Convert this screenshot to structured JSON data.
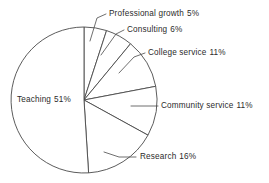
{
  "chart_data": {
    "type": "pie",
    "title": "",
    "subtitle": "",
    "xlabel": "",
    "ylabel": "",
    "legend_position": "none",
    "grid": false,
    "start_angle_deg": 0,
    "direction": "clockwise",
    "units": "percent",
    "total": 100,
    "categories": [
      "Professional growth",
      "Consulting",
      "College service",
      "Community service",
      "Research",
      "Teaching"
    ],
    "values": [
      5,
      6,
      11,
      11,
      16,
      51
    ],
    "slices": [
      {
        "id": "professional-growth",
        "label": "Professional growth",
        "value": 5,
        "value_text": "5%",
        "start_deg": 0,
        "end_deg": 18,
        "label_placement": "outside",
        "fill": "#ffffff",
        "stroke": "#4a4a4a"
      },
      {
        "id": "consulting",
        "label": "Consulting",
        "value": 6,
        "value_text": "6%",
        "start_deg": 18,
        "end_deg": 39.6,
        "label_placement": "outside",
        "fill": "#ffffff",
        "stroke": "#4a4a4a"
      },
      {
        "id": "college-service",
        "label": "College service",
        "value": 11,
        "value_text": "11%",
        "start_deg": 39.6,
        "end_deg": 79.2,
        "label_placement": "outside",
        "fill": "#ffffff",
        "stroke": "#4a4a4a"
      },
      {
        "id": "community-service",
        "label": "Community service",
        "value": 11,
        "value_text": "11%",
        "start_deg": 79.2,
        "end_deg": 118.8,
        "label_placement": "outside",
        "fill": "#ffffff",
        "stroke": "#4a4a4a"
      },
      {
        "id": "research",
        "label": "Research",
        "value": 16,
        "value_text": "16%",
        "start_deg": 118.8,
        "end_deg": 176.4,
        "label_placement": "outside",
        "fill": "#ffffff",
        "stroke": "#4a4a4a"
      },
      {
        "id": "teaching",
        "label": "Teaching",
        "value": 51,
        "value_text": "51%",
        "start_deg": 176.4,
        "end_deg": 360,
        "label_placement": "inside",
        "fill": "#ffffff",
        "stroke": "#4a4a4a"
      }
    ]
  },
  "colors": {
    "background": "#ffffff",
    "slice_fill": "#ffffff",
    "outline": "#4a4a4a",
    "text": "#2b2b2b",
    "leader_line": "#4a4a4a"
  }
}
